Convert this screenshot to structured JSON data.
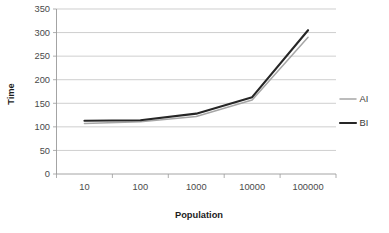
{
  "chart_data": {
    "type": "line",
    "title": "",
    "xlabel": "Population",
    "ylabel": "Time",
    "categories": [
      "10",
      "100",
      "1000",
      "10000",
      "100000"
    ],
    "x_tick_labels": [
      "10",
      "100",
      "1000",
      "10000",
      "100000"
    ],
    "y_tick_labels": [
      "0",
      "50",
      "100",
      "150",
      "200",
      "250",
      "300",
      "350"
    ],
    "y_ticks": [
      0,
      50,
      100,
      150,
      200,
      250,
      300,
      350
    ],
    "ylim": [
      0,
      350
    ],
    "grid": "horizontal",
    "legend_position": "right",
    "series": [
      {
        "name": "AI",
        "color": "#a6a6a6",
        "stroke_width": 1.5,
        "values": [
          107,
          111,
          122,
          157,
          290
        ]
      },
      {
        "name": "BI",
        "color": "#262626",
        "stroke_width": 2.1,
        "values": [
          113,
          114,
          128,
          163,
          305
        ]
      }
    ]
  },
  "legend": {
    "entries": [
      {
        "label": "AI",
        "color": "#a6a6a6"
      },
      {
        "label": "BI",
        "color": "#262626"
      }
    ]
  },
  "colors": {
    "background": "#ffffff",
    "gridline": "#b9b9b9",
    "axis": "#9a9a9a",
    "text": "#3a3a3a",
    "series_ai": "#a6a6a6",
    "series_bi": "#262626"
  }
}
